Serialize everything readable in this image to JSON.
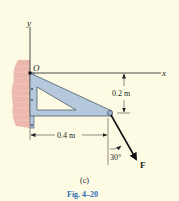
{
  "figure": {
    "caption": "Fig. 4–20",
    "subfigure_label": "(c)",
    "colors": {
      "background": "#fdfbe4",
      "bracket_fill": "#b5c8dc",
      "bracket_stroke": "#3a4a5a",
      "wall": "#e8a59a",
      "caption": "#2a6db5",
      "lines": "#222222"
    }
  },
  "axes": {
    "y_label": "y",
    "x_label": "x",
    "origin_label": "O"
  },
  "dimensions": {
    "vertical": "0.2 m",
    "horizontal": "0.4 m"
  },
  "force": {
    "label": "F",
    "angle_label": "30°"
  }
}
